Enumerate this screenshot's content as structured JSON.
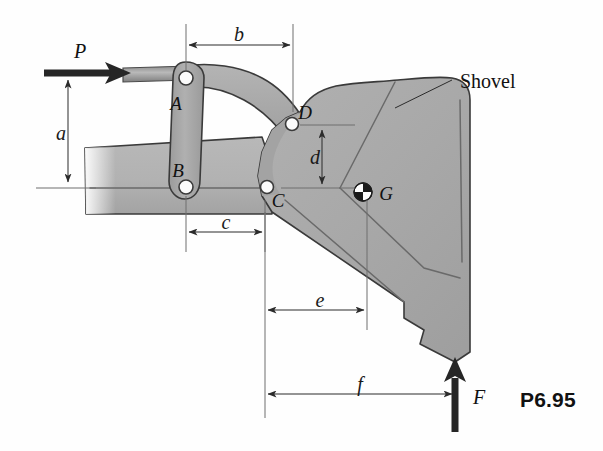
{
  "figure": {
    "number": "P6.95",
    "part_label": "Shovel",
    "background_color": "#fefefe",
    "body_fill": "#a9a9a9",
    "boom_fill": "#b4b4b4",
    "link_fill": "#a6a6a6",
    "outline_color": "#3a3a3a"
  },
  "forces": [
    {
      "name": "P",
      "label": "P",
      "direction": "right",
      "x": 68,
      "y": 73
    },
    {
      "name": "F",
      "label": "F",
      "direction": "up",
      "x": 455,
      "y": 360
    }
  ],
  "pins": [
    {
      "name": "A",
      "label": "A",
      "x": 186,
      "y": 78
    },
    {
      "name": "B",
      "label": "B",
      "x": 186,
      "y": 188
    },
    {
      "name": "C",
      "label": "C",
      "x": 267,
      "y": 187
    },
    {
      "name": "D",
      "label": "D",
      "x": 292,
      "y": 124
    }
  ],
  "centroid": {
    "name": "G",
    "label": "G",
    "x": 363,
    "y": 192
  },
  "dimensions": [
    {
      "name": "a",
      "label": "a",
      "orientation": "vertical",
      "from": 74,
      "to": 188,
      "at": 68
    },
    {
      "name": "b",
      "label": "b",
      "orientation": "horizontal",
      "from": 186,
      "to": 293,
      "at": 45
    },
    {
      "name": "c",
      "label": "c",
      "orientation": "horizontal",
      "from": 186,
      "to": 265,
      "at": 232
    },
    {
      "name": "d",
      "label": "d",
      "orientation": "vertical",
      "from": 125,
      "to": 188,
      "at": 322
    },
    {
      "name": "e",
      "label": "e",
      "orientation": "horizontal",
      "from": 265,
      "to": 367,
      "at": 310
    },
    {
      "name": "f",
      "label": "f",
      "orientation": "horizontal",
      "from": 265,
      "to": 455,
      "at": 394
    }
  ]
}
